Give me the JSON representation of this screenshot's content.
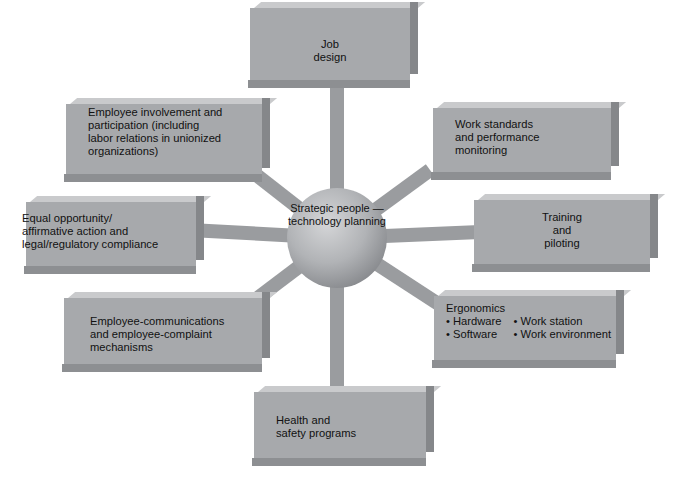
{
  "diagram": {
    "type": "hub-and-spoke",
    "colors": {
      "box_fill": "#a7a9ac",
      "box_top": "#c9cacc",
      "box_side": "#85878a",
      "spoke": "#9a9c9f",
      "hub_highlight": "#d5d6d8",
      "hub_shadow": "#6f7175",
      "text": "#111111",
      "background": "#ffffff"
    },
    "hub": {
      "lines": [
        "Strategic",
        "people —",
        "technology",
        "planning"
      ]
    },
    "nodes": {
      "job_design": {
        "lines": [
          "Job",
          "design"
        ]
      },
      "work_standards": {
        "lines": [
          "Work standards",
          "and performance",
          "monitoring"
        ]
      },
      "training": {
        "lines": [
          "Training",
          "and",
          "piloting"
        ]
      },
      "ergonomics": {
        "title": "Ergonomics",
        "bullets": [
          "Hardware",
          "Work station",
          "Software",
          "Work environment"
        ]
      },
      "health_safety": {
        "lines": [
          "Health and",
          "safety programs"
        ]
      },
      "employee_communications": {
        "lines": [
          "Employee-communications",
          "and employee-complaint",
          "mechanisms"
        ]
      },
      "equal_opportunity": {
        "lines": [
          "Equal opportunity/",
          "affirmative action and",
          "legal/regulatory compliance"
        ]
      },
      "employee_involvement": {
        "lines": [
          "Employee involvement and",
          "participation (including",
          "labor relations in unionized",
          "organizations)"
        ]
      }
    }
  }
}
